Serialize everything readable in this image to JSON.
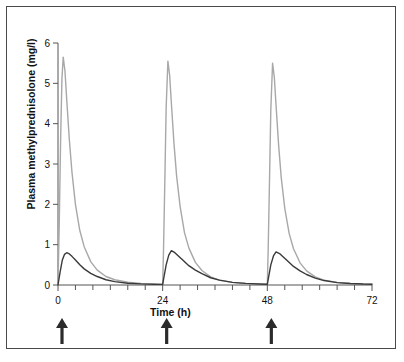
{
  "figure": {
    "border_color": "#4a4a4a",
    "background": "#ffffff"
  },
  "chart_data": {
    "type": "line",
    "title": "",
    "xlabel": "Time (h)",
    "ylabel": "Plasma methylprednisolone (mg/l)",
    "xlim": [
      0,
      72
    ],
    "ylim": [
      0,
      6
    ],
    "xticks": [
      0,
      24,
      48,
      72
    ],
    "xtick_labels": [
      "0",
      "24",
      "48",
      "72"
    ],
    "xminor_tick_interval": 4,
    "yticks": [
      0,
      1,
      2,
      3,
      4,
      5,
      6
    ],
    "ytick_labels": [
      "0",
      "1",
      "2",
      "3",
      "4",
      "5",
      "6"
    ],
    "grid": false,
    "legend": "none",
    "series": [
      {
        "name": "high-peak-profile",
        "color": "#a8a8a8",
        "linewidth": 1.4,
        "peaks": [
          {
            "time": 1.2,
            "value": 5.65
          },
          {
            "time": 25.2,
            "value": 5.55
          },
          {
            "time": 49.2,
            "value": 5.5
          }
        ],
        "x": [
          0,
          0.3,
          0.6,
          0.9,
          1.2,
          1.6,
          2.0,
          2.6,
          3.2,
          4.0,
          5.0,
          6.0,
          7.5,
          9.0,
          11.0,
          13.0,
          16.0,
          19.0,
          22.0,
          24.0,
          24.2,
          24.5,
          24.8,
          25.2,
          25.6,
          26.0,
          26.6,
          27.2,
          28.0,
          29.0,
          30.0,
          31.5,
          33.0,
          35.0,
          37.0,
          40.0,
          43.0,
          46.0,
          48.0,
          48.2,
          48.5,
          48.8,
          49.2,
          49.6,
          50.0,
          50.6,
          51.2,
          52.0,
          53.0,
          54.0,
          55.5,
          57.0,
          59.0,
          61.0,
          64.0,
          67.0,
          70.0,
          72.0
        ],
        "y": [
          0.0,
          1.6,
          3.6,
          5.1,
          5.65,
          5.3,
          4.6,
          3.6,
          2.8,
          2.0,
          1.35,
          0.95,
          0.58,
          0.37,
          0.21,
          0.13,
          0.07,
          0.04,
          0.02,
          0.015,
          0.9,
          2.6,
          4.4,
          5.55,
          5.2,
          4.5,
          3.5,
          2.7,
          1.95,
          1.3,
          0.92,
          0.56,
          0.36,
          0.2,
          0.12,
          0.065,
          0.038,
          0.022,
          0.015,
          0.9,
          2.6,
          4.35,
          5.5,
          5.15,
          4.45,
          3.45,
          2.65,
          1.9,
          1.28,
          0.9,
          0.55,
          0.35,
          0.2,
          0.12,
          0.065,
          0.038,
          0.022,
          0.018
        ]
      },
      {
        "name": "low-peak-profile",
        "color": "#3a3a3a",
        "linewidth": 1.4,
        "peaks": [
          {
            "time": 2.0,
            "value": 0.8
          },
          {
            "time": 26.0,
            "value": 0.85
          },
          {
            "time": 50.0,
            "value": 0.82
          }
        ],
        "x": [
          0,
          0.5,
          1.0,
          1.5,
          2.0,
          2.6,
          3.2,
          4.0,
          5.0,
          6.0,
          7.5,
          9.0,
          11.0,
          13.0,
          16.0,
          19.0,
          22.0,
          24.0,
          24.3,
          24.8,
          25.4,
          26.0,
          26.8,
          27.6,
          28.6,
          30.0,
          31.5,
          33.0,
          35.0,
          37.0,
          40.0,
          43.0,
          46.0,
          48.0,
          48.3,
          48.8,
          49.4,
          50.0,
          50.8,
          51.6,
          52.6,
          54.0,
          55.5,
          57.0,
          59.0,
          61.0,
          64.0,
          67.0,
          70.0,
          72.0
        ],
        "y": [
          0.0,
          0.33,
          0.62,
          0.76,
          0.8,
          0.77,
          0.71,
          0.62,
          0.5,
          0.4,
          0.29,
          0.21,
          0.13,
          0.085,
          0.045,
          0.027,
          0.018,
          0.015,
          0.2,
          0.5,
          0.74,
          0.85,
          0.8,
          0.72,
          0.62,
          0.48,
          0.37,
          0.28,
          0.18,
          0.12,
          0.065,
          0.04,
          0.025,
          0.018,
          0.2,
          0.5,
          0.72,
          0.82,
          0.78,
          0.7,
          0.6,
          0.46,
          0.35,
          0.26,
          0.17,
          0.11,
          0.06,
          0.038,
          0.024,
          0.02
        ]
      }
    ],
    "annotations": {
      "dose_arrows": {
        "name": "dose-arrow",
        "times": [
          0,
          24,
          48
        ],
        "color": "#2b2b2b",
        "description": "upward arrows below x-axis marking dose administration"
      }
    }
  }
}
